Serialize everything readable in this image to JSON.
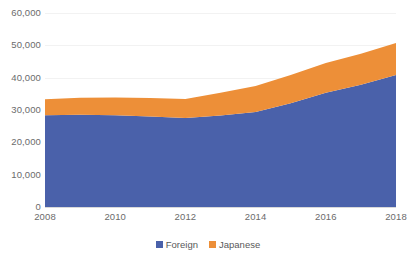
{
  "chart_data": {
    "type": "area",
    "stacked": true,
    "title": "",
    "subtitle": "",
    "xlabel": "",
    "ylabel": "",
    "x": [
      2008,
      2009,
      2010,
      2011,
      2012,
      2013,
      2014,
      2015,
      2016,
      2017,
      2018
    ],
    "categories": [
      "2008",
      "2009",
      "2010",
      "2011",
      "2012",
      "2013",
      "2014",
      "2015",
      "2016",
      "2017",
      "2018"
    ],
    "series": [
      {
        "name": "Foreign",
        "color": "#4A61AA",
        "values": [
          28400,
          28500,
          28400,
          28000,
          27500,
          28300,
          29400,
          32100,
          35300,
          37800,
          40800
        ]
      },
      {
        "name": "Japanese",
        "color": "#ED8F38",
        "values": [
          4900,
          5300,
          5500,
          5700,
          5900,
          7000,
          8000,
          8700,
          9200,
          9600,
          9900
        ]
      }
    ],
    "totals": [
      33300,
      33800,
      33900,
      33700,
      33400,
      35300,
      37400,
      40800,
      44500,
      47400,
      50700
    ],
    "ylim": [
      0,
      60000
    ],
    "xlim": [
      2008,
      2018
    ],
    "y_ticks": [
      0,
      10000,
      20000,
      30000,
      40000,
      50000,
      60000
    ],
    "y_tick_labels": [
      "0",
      "10,000",
      "20,000",
      "30,000",
      "40,000",
      "50,000",
      "60,000"
    ],
    "x_ticks": [
      2008,
      2010,
      2012,
      2014,
      2016,
      2018
    ],
    "x_tick_labels": [
      "2008",
      "2010",
      "2012",
      "2014",
      "2016",
      "2018"
    ],
    "grid": true,
    "grid_axis": "y",
    "legend": [
      "Foreign",
      "Japanese"
    ],
    "legend_position": "bottom",
    "colors": {
      "foreign": "#4A61AA",
      "japanese": "#ED8F38",
      "gridline": "#F2F2F2",
      "axis": "#D9D9D9",
      "tick_text": "#6B6B6B",
      "legend_text": "#595959",
      "background": "#FFFFFF"
    }
  },
  "legend": {
    "items": [
      {
        "label": "Foreign",
        "swatch_name": "legend-swatch-foreign"
      },
      {
        "label": "Japanese",
        "swatch_name": "legend-swatch-japanese"
      }
    ]
  }
}
